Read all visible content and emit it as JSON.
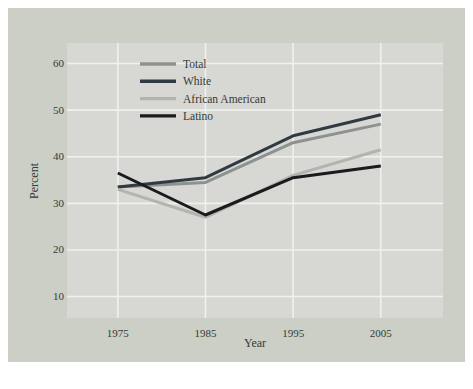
{
  "figure": {
    "background_color": "#cbcfc5",
    "plot_background_color": "#d7d8d3",
    "gridline_color": "#f0f1ec",
    "text_color": "#343a38"
  },
  "chart_data": {
    "type": "line",
    "title": "",
    "xlabel": "Year",
    "ylabel": "Percent",
    "x": [
      1975,
      1985,
      1995,
      2005
    ],
    "x_tick_labels": [
      "1975",
      "1985",
      "1995",
      "2005"
    ],
    "y_ticks": [
      10,
      20,
      30,
      40,
      50,
      60
    ],
    "y_tick_labels": [
      "10",
      "20",
      "30",
      "40",
      "50",
      "60"
    ],
    "xlim": [
      1969.2,
      2012.1
    ],
    "ylim": [
      5.4,
      64.4
    ],
    "grid": true,
    "legend_position": "upper-left",
    "series": [
      {
        "name": "Total",
        "color": "#8e928f",
        "values": [
          33.5,
          34.5,
          43.0,
          47.0
        ]
      },
      {
        "name": "White",
        "color": "#2f3a42",
        "values": [
          33.5,
          35.5,
          44.5,
          49.0
        ]
      },
      {
        "name": "African American",
        "color": "#b2b4ae",
        "values": [
          33.0,
          27.0,
          36.0,
          41.5
        ]
      },
      {
        "name": "Latino",
        "color": "#191b1d",
        "values": [
          36.5,
          27.5,
          35.5,
          38.0
        ]
      }
    ]
  }
}
